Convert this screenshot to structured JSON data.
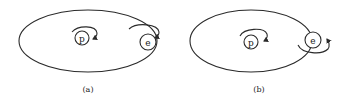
{
  "diagram": {
    "panels": [
      {
        "id": "a",
        "caption": "(a)",
        "orbit": {
          "cx": 88,
          "cy": 41,
          "rx": 69,
          "ry": 31
        },
        "proton": {
          "label": "p",
          "cx": 82,
          "cy": 38,
          "r": 7,
          "spin": "top-clockwise"
        },
        "electron": {
          "label": "e",
          "cx": 148,
          "cy": 42,
          "r": 8,
          "spin": "top-clockwise"
        },
        "relation": "parallel spins"
      },
      {
        "id": "b",
        "caption": "(b)",
        "orbit": {
          "cx": 251,
          "cy": 41,
          "rx": 61,
          "ry": 31
        },
        "proton": {
          "label": "p",
          "cx": 251,
          "cy": 42,
          "r": 7,
          "spin": "top-clockwise"
        },
        "electron": {
          "label": "e",
          "cx": 313,
          "cy": 40,
          "r": 8,
          "spin": "bottom-counterclockwise"
        },
        "relation": "antiparallel spins"
      }
    ],
    "colors": {
      "line": "#2a2a2a",
      "background": "#ffffff"
    }
  }
}
